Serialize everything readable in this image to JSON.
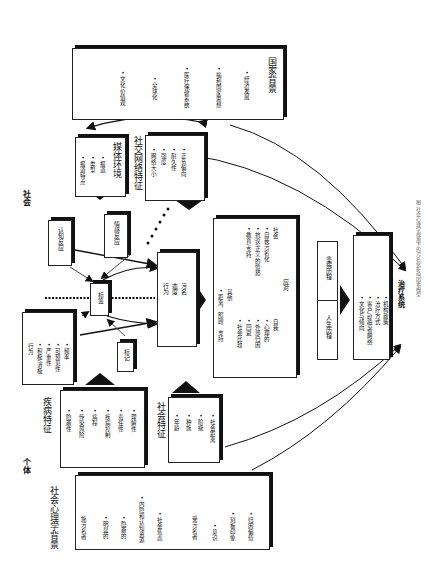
{
  "section_labels": {
    "society": "社会",
    "individual": "个体"
  },
  "national": {
    "title": "国家背景",
    "items": [
      "• 经济发展",
      "• 福利国家思想",
      "• 医疗保健系统",
      "• 全球化",
      "• 文化价值观"
    ]
  },
  "media": {
    "title": "媒体环境",
    "items": [
      "• 报道",
      "• 类型",
      "• 报道特点"
    ]
  },
  "social_network": {
    "title": "社交网络特征",
    "items": [
      "• 网络大小",
      "• 强度",
      "• 耐久性",
      "• 正负偏向"
    ]
  },
  "cognitive": {
    "label": "认知反应"
  },
  "emotional": {
    "label": "情感反应"
  },
  "label_box": {
    "label": "标签"
  },
  "mark": {
    "label": "标记"
  },
  "stigma": {
    "lines": [
      "污名",
      "态度",
      "行为"
    ]
  },
  "coping": {
    "title": "应对",
    "self_title": "自我",
    "self_items": [
      "• 心理的",
      "• 外部归因",
      "• 回避",
      "• 社会比较"
    ],
    "social_title": "社会",
    "social_items": [
      "• 自我污名化",
      "• 抗议/正义的愤怒",
      "• 教育/支持"
    ],
    "other_title": "其他",
    "other_items": [
      "• 距离、照顾、支持"
    ]
  },
  "illness_history": {
    "label": "患病历程"
  },
  "life_history": {
    "label": "人生历程"
  },
  "treatment": {
    "title": "治疗系统",
    "items": [
      "• 文化与倾向",
      "• 客户/提供者网络",
      "• 治疗方式",
      "• 机构政策"
    ]
  },
  "behavior": {
    "title": "行为",
    "items": [
      "• 积极/消极",
      "• 严重性",
      "• 可预见性",
      "• 频率"
    ]
  },
  "disease": {
    "title": "疾病特征",
    "items": [
      "• 隐蔽性",
      "• 传染风险",
      "• 病程",
      "• 疾病控制",
      "• 责任性",
      "• 理解性"
    ]
  },
  "social_features": {
    "title": "社会特征",
    "items": [
      "• 年龄",
      "• 种族",
      "• 阶级",
      "• 社会距离"
    ]
  },
  "psych": {
    "title": "社会心理学背景",
    "stigmatizer_title": "施污名者",
    "stigmatizer_items": [
      "• 明显的",
      "• 隐蔽的",
      "• 内隐和认知资源",
      "• 社会焦虑"
    ],
    "stigmatized_title": "受污名者",
    "stigmatized_items": [
      "• 意识",
      "• 刻板印象",
      "• 归因偏倚"
    ]
  },
  "caption": "图 社会心理学视角下的污名化影响因素模型"
}
